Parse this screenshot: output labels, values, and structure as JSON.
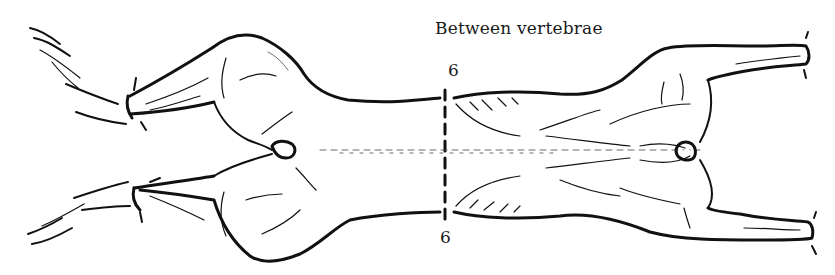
{
  "diagram": {
    "annotation": "Between vertebrae",
    "cut_line": {
      "id": "6",
      "label_top": "6",
      "label_bottom": "6",
      "style": "dashed vertical"
    },
    "parts": [
      "hind-leg-upper",
      "hind-leg-lower",
      "hind-foot-upper",
      "hind-foot-lower",
      "loin",
      "rib-section",
      "fore-leg-upper",
      "fore-leg-lower",
      "tail-vent",
      "neck-vent"
    ],
    "colors": {
      "ink": "#111111",
      "background": "#ffffff"
    }
  }
}
